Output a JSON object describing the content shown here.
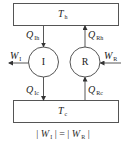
{
  "diagram": {
    "hot_reservoir": {
      "symbol": "T",
      "subscript": "h"
    },
    "cold_reservoir": {
      "symbol": "T",
      "subscript": "c"
    },
    "engine": {
      "label": "I"
    },
    "refrigerator": {
      "label": "R"
    },
    "flows": {
      "q_ih": {
        "symbol": "Q",
        "subscript": "Ih"
      },
      "q_ic": {
        "symbol": "Q",
        "subscript": "Ic"
      },
      "q_rh": {
        "symbol": "Q",
        "subscript": "Rh"
      },
      "q_rc": {
        "symbol": "Q",
        "subscript": "Rc"
      },
      "w_i": {
        "symbol": "W",
        "subscript": "I"
      },
      "w_r": {
        "symbol": "W",
        "subscript": "R"
      }
    },
    "equation": {
      "left_bar": "|",
      "left_symbol": "W",
      "left_subscript": "I",
      "equals": "=",
      "right_symbol": "W",
      "right_subscript": "R",
      "right_bar": "|"
    },
    "colors": {
      "stroke": "#444444",
      "text": "#222222",
      "background": "#ffffff"
    }
  }
}
